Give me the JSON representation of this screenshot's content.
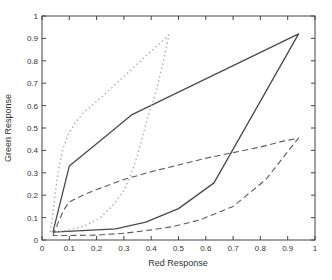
{
  "figure": {
    "background": "#ffffff",
    "axis_color": "#444444",
    "tick_label_color": "#333333"
  },
  "chart_data": {
    "type": "line",
    "title": "",
    "xlabel": "Red Response",
    "ylabel": "Green Response",
    "xlim": [
      0,
      1
    ],
    "ylim": [
      0,
      1
    ],
    "grid": false,
    "legend": null,
    "xticks": [
      0,
      0.1,
      0.2,
      0.3,
      0.4,
      0.5,
      0.6,
      0.7,
      0.8,
      0.9,
      1
    ],
    "yticks": [
      0,
      0.1,
      0.2,
      0.3,
      0.4,
      0.5,
      0.6,
      0.7,
      0.8,
      0.9,
      1
    ],
    "xtick_labels": [
      "0",
      "0.1",
      "0.2",
      "0.3",
      "0.4",
      "0.5",
      "0.6",
      "0.7",
      "0.8",
      "0.9",
      "1"
    ],
    "ytick_labels": [
      "0",
      "0.1",
      "0.2",
      "0.3",
      "0.4",
      "0.5",
      "0.6",
      "0.7",
      "0.8",
      "0.9",
      "1"
    ],
    "series": [
      {
        "name": "solid-loop",
        "style": "solid",
        "color": "#4a4a4a",
        "width": 1.3,
        "points": [
          [
            0.04,
            0.035
          ],
          [
            0.1,
            0.33
          ],
          [
            0.22,
            0.45
          ],
          [
            0.33,
            0.56
          ],
          [
            0.94,
            0.92
          ],
          [
            0.63,
            0.255
          ],
          [
            0.5,
            0.14
          ],
          [
            0.38,
            0.08
          ],
          [
            0.27,
            0.05
          ],
          [
            0.04,
            0.035
          ]
        ]
      },
      {
        "name": "dotted-loop",
        "style": "dotted",
        "color": "#aeaeae",
        "width": 1.4,
        "points": [
          [
            0.03,
            0.035
          ],
          [
            0.04,
            0.12
          ],
          [
            0.05,
            0.22
          ],
          [
            0.06,
            0.31
          ],
          [
            0.075,
            0.4
          ],
          [
            0.095,
            0.47
          ],
          [
            0.12,
            0.52
          ],
          [
            0.15,
            0.565
          ],
          [
            0.22,
            0.64
          ],
          [
            0.3,
            0.73
          ],
          [
            0.38,
            0.82
          ],
          [
            0.465,
            0.915
          ],
          [
            0.445,
            0.8
          ],
          [
            0.425,
            0.7
          ],
          [
            0.41,
            0.63
          ],
          [
            0.39,
            0.56
          ],
          [
            0.37,
            0.47
          ],
          [
            0.35,
            0.38
          ],
          [
            0.325,
            0.29
          ],
          [
            0.3,
            0.22
          ],
          [
            0.26,
            0.155
          ],
          [
            0.21,
            0.095
          ],
          [
            0.15,
            0.06
          ],
          [
            0.09,
            0.042
          ],
          [
            0.03,
            0.035
          ]
        ]
      },
      {
        "name": "dashed-loop",
        "style": "dashed",
        "color": "#5a5a5a",
        "width": 1.1,
        "points": [
          [
            0.04,
            0.02
          ],
          [
            0.06,
            0.08
          ],
          [
            0.08,
            0.135
          ],
          [
            0.1,
            0.17
          ],
          [
            0.15,
            0.2
          ],
          [
            0.2,
            0.225
          ],
          [
            0.3,
            0.27
          ],
          [
            0.4,
            0.305
          ],
          [
            0.5,
            0.335
          ],
          [
            0.6,
            0.365
          ],
          [
            0.7,
            0.39
          ],
          [
            0.8,
            0.415
          ],
          [
            0.88,
            0.44
          ],
          [
            0.94,
            0.455
          ],
          [
            0.91,
            0.41
          ],
          [
            0.82,
            0.27
          ],
          [
            0.7,
            0.15
          ],
          [
            0.58,
            0.09
          ],
          [
            0.48,
            0.06
          ],
          [
            0.4,
            0.045
          ],
          [
            0.3,
            0.03
          ],
          [
            0.2,
            0.022
          ],
          [
            0.1,
            0.02
          ],
          [
            0.04,
            0.02
          ]
        ]
      }
    ]
  }
}
